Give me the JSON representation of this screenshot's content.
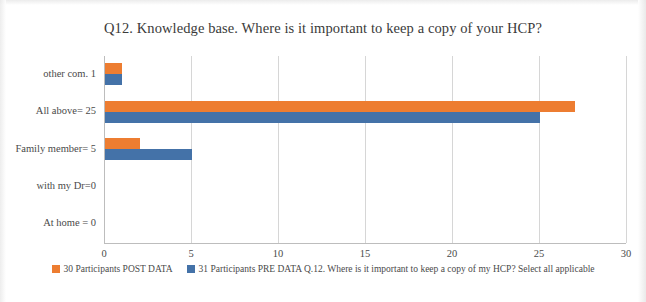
{
  "chart_data": {
    "type": "bar",
    "orientation": "horizontal",
    "title": "Q12. Knowledge base. Where is it important to keep a copy of your HCP?",
    "xlabel": "",
    "ylabel": "",
    "xlim": [
      0,
      30
    ],
    "xticks": [
      "0",
      "5",
      "10",
      "15",
      "20",
      "25",
      "30"
    ],
    "xtick_values": [
      0,
      5,
      10,
      15,
      20,
      25,
      30
    ],
    "grid": true,
    "legend_position": "bottom",
    "categories": [
      "At home = 0",
      "with my Dr=0",
      "Family member= 5",
      "All above= 25",
      "other com.  1"
    ],
    "series": [
      {
        "name": "30 Participants POST DATA",
        "color": "#ed7d31",
        "values": [
          0,
          0,
          2,
          27,
          1
        ]
      },
      {
        "name": "31 Participants PRE DATA Q.12. Where is it important to keep a copy of my HCP? Select all applicable",
        "color": "#4472a8",
        "values": [
          0,
          0,
          5,
          25,
          1
        ]
      }
    ]
  },
  "legend": {
    "items": [
      {
        "label": "30 Participants POST DATA",
        "color": "#ed7d31"
      },
      {
        "label": "31 Participants PRE DATA Q.12. Where is it important to keep a copy of my HCP? Select all applicable",
        "color": "#4472a8"
      }
    ]
  }
}
